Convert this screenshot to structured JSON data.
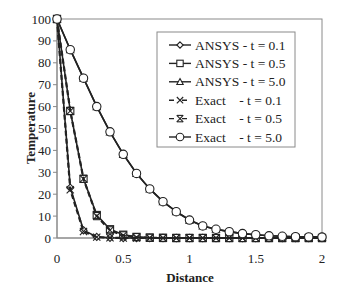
{
  "chart_data": {
    "type": "line",
    "title": "",
    "xlabel": "Distance",
    "ylabel": "Temperature",
    "xlim": [
      0,
      2
    ],
    "ylim": [
      0,
      100
    ],
    "xticks": [
      0,
      0.5,
      1,
      1.5,
      2
    ],
    "xtick_labels": [
      "0",
      "0.5",
      "1",
      "1.5",
      "2"
    ],
    "yticks": [
      0,
      10,
      20,
      30,
      40,
      50,
      60,
      70,
      80,
      90,
      100
    ],
    "ytick_labels": [
      "0",
      "10",
      "20",
      "30",
      "40",
      "50",
      "60",
      "70",
      "80",
      "90",
      "100"
    ],
    "grid": false,
    "legend_position": "upper right (inside)",
    "x": [
      0,
      0.1,
      0.2,
      0.3,
      0.4,
      0.5,
      0.6,
      0.7,
      0.8,
      0.9,
      1.0,
      1.1,
      1.2,
      1.3,
      1.4,
      1.5,
      1.6,
      1.7,
      1.8,
      1.9,
      2.0
    ],
    "series": [
      {
        "name": "ANSYS - t = 0.1",
        "marker": "diamond",
        "dash": false,
        "values": [
          100,
          23,
          3.5,
          0.5,
          0.1,
          0,
          0,
          0,
          0,
          0,
          0,
          0,
          0,
          0,
          0,
          0,
          0,
          0,
          0,
          0,
          0
        ]
      },
      {
        "name": "ANSYS - t = 0.5",
        "marker": "square",
        "dash": false,
        "values": [
          100,
          58,
          27,
          10.5,
          4,
          1.5,
          0.5,
          0.2,
          0.1,
          0,
          0,
          0,
          0,
          0,
          0,
          0,
          0,
          0,
          0,
          0,
          0
        ]
      },
      {
        "name": "ANSYS - t = 5.0",
        "marker": "triangle",
        "dash": false,
        "values": [
          100,
          86,
          73,
          60,
          48.5,
          38.2,
          29.5,
          22.4,
          16.6,
          12.0,
          8.2,
          5.5,
          4.0,
          2.9,
          2.0,
          1.5,
          1.0,
          0.8,
          0.6,
          0.5,
          0.4
        ]
      },
      {
        "name": "Exact - t = 0.1",
        "marker": "x",
        "dash": true,
        "values": [
          100,
          22,
          3,
          0.4,
          0.1,
          0,
          0,
          0,
          0,
          0,
          0,
          0,
          0,
          0,
          0,
          0,
          0,
          0,
          0,
          0,
          0
        ]
      },
      {
        "name": "Exact - t = 0.5",
        "marker": "asterisk",
        "dash": true,
        "values": [
          100,
          58,
          27,
          10,
          3.5,
          1.2,
          0.4,
          0.1,
          0,
          0,
          0,
          0,
          0,
          0,
          0,
          0,
          0,
          0,
          0,
          0,
          0
        ]
      },
      {
        "name": "Exact - t = 5.0",
        "marker": "circle",
        "dash": false,
        "values": [
          100,
          86,
          73,
          60,
          48.5,
          38.2,
          29.5,
          22.4,
          16.6,
          12.0,
          8.2,
          5.5,
          4.0,
          2.9,
          2.0,
          1.5,
          1.0,
          0.8,
          0.6,
          0.5,
          0.4
        ]
      }
    ]
  },
  "legend": {
    "items": [
      {
        "label": "ANSYS - t = 0.1",
        "marker": "diamond"
      },
      {
        "label": "ANSYS - t = 0.5",
        "marker": "square"
      },
      {
        "label": "ANSYS - t = 5.0",
        "marker": "triangle"
      },
      {
        "label": "Exact    - t = 0.1",
        "marker": "x"
      },
      {
        "label": "Exact    - t = 0.5",
        "marker": "asterisk"
      },
      {
        "label": "Exact    - t = 5.0",
        "marker": "circle"
      }
    ]
  },
  "colors": {
    "line": "#222222",
    "axis": "#888888",
    "frame": "#777777",
    "background": "#ffffff"
  }
}
